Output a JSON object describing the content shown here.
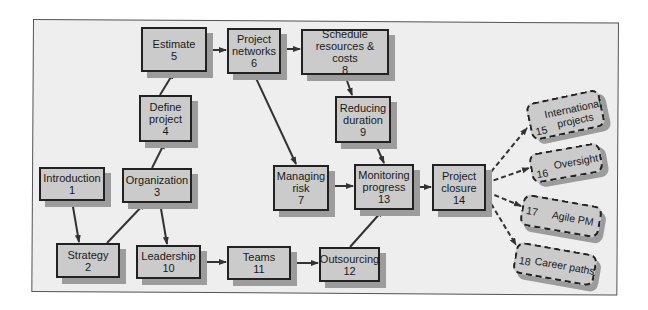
{
  "colors": {
    "frame_bg": "#eeeeee",
    "node_fill": "#cbcbcb",
    "node_border": "#222222",
    "shadow": "#9c9c9c",
    "arrow": "#333333"
  },
  "nodes": [
    {
      "id": 1,
      "label": "Introduction",
      "num": "1"
    },
    {
      "id": 2,
      "label": "Strategy",
      "num": "2"
    },
    {
      "id": 3,
      "label": "Organization",
      "num": "3"
    },
    {
      "id": 4,
      "label": "Define\nproject",
      "num": "4"
    },
    {
      "id": 5,
      "label": "Estimate",
      "num": "5"
    },
    {
      "id": 6,
      "label": "Project\nnetworks",
      "num": "6"
    },
    {
      "id": 7,
      "label": "Managing\nrisk",
      "num": "7"
    },
    {
      "id": 8,
      "label": "Schedule\nresources & costs",
      "num": "8"
    },
    {
      "id": 9,
      "label": "Reducing\nduration",
      "num": "9"
    },
    {
      "id": 10,
      "label": "Leadership",
      "num": "10"
    },
    {
      "id": 11,
      "label": "Teams",
      "num": "11"
    },
    {
      "id": 12,
      "label": "Outsourcing",
      "num": "12"
    },
    {
      "id": 13,
      "label": "Monitoring\nprogress",
      "num": "13"
    },
    {
      "id": 14,
      "label": "Project\nclosure",
      "num": "14"
    }
  ],
  "optional_nodes": [
    {
      "id": 15,
      "label": "International\nprojects",
      "num": "15"
    },
    {
      "id": 16,
      "label": "Oversight",
      "num": "16"
    },
    {
      "id": 17,
      "label": "Agile PM",
      "num": "17"
    },
    {
      "id": 18,
      "label": "Career paths",
      "num": "18"
    }
  ],
  "edges": [
    {
      "from": 1,
      "to": 2,
      "style": "solid"
    },
    {
      "from": 2,
      "to": 3,
      "style": "solid"
    },
    {
      "from": 3,
      "to": 4,
      "style": "solid"
    },
    {
      "from": 3,
      "to": 10,
      "style": "solid"
    },
    {
      "from": 4,
      "to": 5,
      "style": "solid"
    },
    {
      "from": 5,
      "to": 6,
      "style": "solid"
    },
    {
      "from": 6,
      "to": 8,
      "style": "solid"
    },
    {
      "from": 6,
      "to": 7,
      "style": "solid"
    },
    {
      "from": 8,
      "to": 9,
      "style": "solid"
    },
    {
      "from": 9,
      "to": 13,
      "style": "solid"
    },
    {
      "from": 7,
      "to": 13,
      "style": "solid"
    },
    {
      "from": 10,
      "to": 11,
      "style": "solid"
    },
    {
      "from": 11,
      "to": 12,
      "style": "solid"
    },
    {
      "from": 12,
      "to": 13,
      "style": "solid"
    },
    {
      "from": 13,
      "to": 14,
      "style": "solid"
    },
    {
      "from": 14,
      "to": 15,
      "style": "dashed"
    },
    {
      "from": 14,
      "to": 16,
      "style": "dashed"
    },
    {
      "from": 14,
      "to": 17,
      "style": "dashed"
    },
    {
      "from": 14,
      "to": 18,
      "style": "dashed"
    }
  ]
}
